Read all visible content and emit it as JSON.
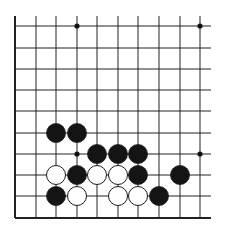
{
  "board": {
    "description": "Go board fragment (lower-left region), left and bottom edges shown",
    "columns_x": [
      15,
      36,
      56,
      77,
      97,
      118,
      138,
      159,
      180,
      200
    ],
    "rows_y": [
      26,
      48,
      69,
      90,
      111,
      133,
      154,
      175,
      196,
      218
    ],
    "line_color": "#222222",
    "background": "#ffffff",
    "edges": {
      "left": true,
      "bottom": true,
      "top": false,
      "right": false
    },
    "right_extent": 211,
    "top_extent": 16,
    "star_points": [
      {
        "col": 3,
        "row": 0
      },
      {
        "col": 9,
        "row": 0
      },
      {
        "col": 3,
        "row": 6
      },
      {
        "col": 9,
        "row": 6
      }
    ],
    "stones": [
      {
        "color": "black",
        "col": 2,
        "row": 5
      },
      {
        "color": "black",
        "col": 3,
        "row": 5
      },
      {
        "color": "black",
        "col": 4,
        "row": 6
      },
      {
        "color": "black",
        "col": 5,
        "row": 6
      },
      {
        "color": "black",
        "col": 6,
        "row": 6
      },
      {
        "color": "white",
        "col": 2,
        "row": 7
      },
      {
        "color": "black",
        "col": 3,
        "row": 7
      },
      {
        "color": "white",
        "col": 4,
        "row": 7
      },
      {
        "color": "white",
        "col": 5,
        "row": 7
      },
      {
        "color": "black",
        "col": 6,
        "row": 7
      },
      {
        "color": "black",
        "col": 8,
        "row": 7
      },
      {
        "color": "black",
        "col": 2,
        "row": 8
      },
      {
        "color": "white",
        "col": 3,
        "row": 8
      },
      {
        "color": "white",
        "col": 5,
        "row": 8
      },
      {
        "color": "white",
        "col": 6,
        "row": 8
      },
      {
        "color": "black",
        "col": 7,
        "row": 8
      }
    ],
    "stone_radius": 9.5
  }
}
